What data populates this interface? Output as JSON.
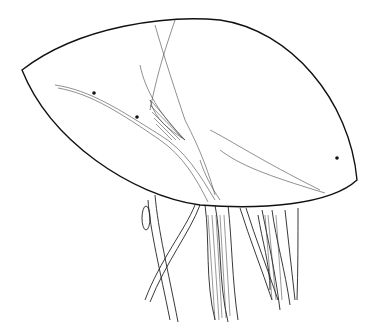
{
  "figure": {
    "type": "anatomical line illustration",
    "background": "#ffffff",
    "ink": "#1a1a1a",
    "markers": [
      {
        "name": "marker-dot-1",
        "x": 94,
        "y": 93
      },
      {
        "name": "marker-dot-2",
        "x": 137,
        "y": 117
      },
      {
        "name": "marker-dot-3",
        "x": 337,
        "y": 158
      }
    ]
  }
}
